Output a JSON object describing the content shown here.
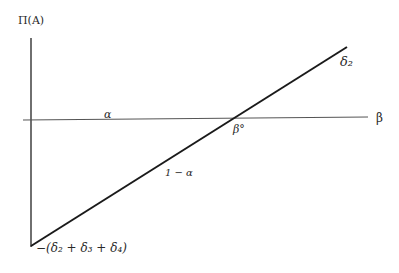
{
  "diagram": {
    "y_axis_label": "Π(A)",
    "x_axis_label": "β",
    "horizontal_line_label": "α",
    "intercept_label": "β°",
    "slope_label": "1 − α",
    "top_right_label": "δ₂",
    "bottom_label": "−(δ₂ + δ₃ + δ₄)",
    "colors": {
      "line": "#1a1a1a",
      "axis": "#333333",
      "horizontal": "#555555",
      "background": "#ffffff"
    },
    "geometry": {
      "y_axis": {
        "x": 31,
        "y1": 38,
        "y2": 247
      },
      "horizontal_line": {
        "x1": 23,
        "y1": 120,
        "x2": 368,
        "y2": 117
      },
      "diagonal_line": {
        "x1": 31,
        "y1": 246,
        "x2": 347,
        "y2": 47
      },
      "intersection": {
        "x": 233,
        "y": 119
      }
    }
  }
}
